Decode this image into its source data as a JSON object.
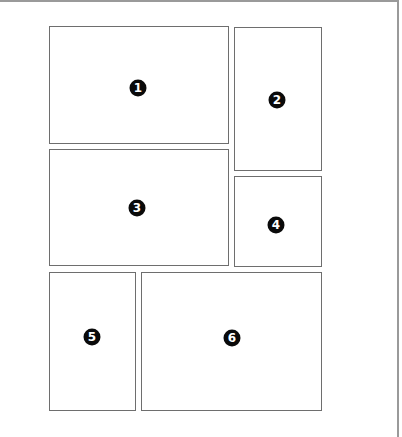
{
  "diagram": {
    "type": "panel-layout",
    "panels": [
      {
        "id": 1,
        "label": "1",
        "x": 49,
        "y": 26,
        "w": 180,
        "h": 118,
        "badge_x": 138,
        "badge_y": 88
      },
      {
        "id": 2,
        "label": "2",
        "x": 234,
        "y": 27,
        "w": 88,
        "h": 144,
        "badge_x": 277,
        "badge_y": 100
      },
      {
        "id": 3,
        "label": "3",
        "x": 49,
        "y": 149,
        "w": 180,
        "h": 117,
        "badge_x": 137,
        "badge_y": 208
      },
      {
        "id": 4,
        "label": "4",
        "x": 234,
        "y": 176,
        "w": 88,
        "h": 91,
        "badge_x": 276,
        "badge_y": 225
      },
      {
        "id": 5,
        "label": "5",
        "x": 49,
        "y": 272,
        "w": 87,
        "h": 139,
        "badge_x": 92,
        "badge_y": 337
      },
      {
        "id": 6,
        "label": "6",
        "x": 141,
        "y": 272,
        "w": 181,
        "h": 139,
        "badge_x": 232,
        "badge_y": 338
      }
    ],
    "colors": {
      "panel_border": "#6e6e6e",
      "frame_border": "#9a9a9a",
      "badge_fill": "#0a0a0a",
      "badge_text": "#ffffff",
      "background": "#ffffff"
    }
  }
}
